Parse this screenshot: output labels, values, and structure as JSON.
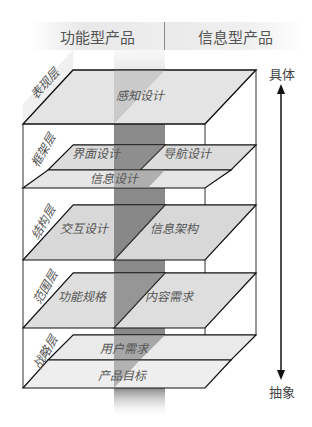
{
  "header": {
    "left": "功能型产品",
    "right": "信息型产品"
  },
  "axis": {
    "top": "具体",
    "bottom": "抽象"
  },
  "layers": [
    {
      "name": "表现层",
      "items": [
        "感知设计"
      ]
    },
    {
      "name": "框架层",
      "items": [
        "界面设计",
        "导航设计",
        "信息设计"
      ]
    },
    {
      "name": "结构层",
      "items": [
        "交互设计",
        "信息架构"
      ]
    },
    {
      "name": "范围层",
      "items": [
        "功能规格",
        "内容需求"
      ]
    },
    {
      "name": "战略层",
      "items": [
        "用户需求",
        "产品目标"
      ]
    }
  ],
  "colors": {
    "plane": "#e2e2e2",
    "band": "#8a8a8a",
    "line": "#111111"
  }
}
